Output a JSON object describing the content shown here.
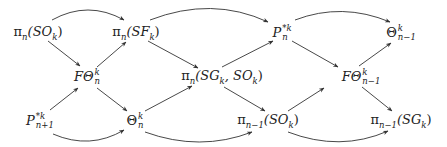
{
  "diagram": {
    "type": "commutative-diagram",
    "nodes": [
      {
        "id": "piSO",
        "label": "π_n(SO_k)",
        "base": "π",
        "sub": "n",
        "arg": "(SO",
        "argsub": "k",
        "close": ")",
        "x": 38,
        "y": 33
      },
      {
        "id": "piSF",
        "label": "π_n(SF_k)",
        "base": "π",
        "sub": "n",
        "arg": "(SF",
        "argsub": "k",
        "close": ")",
        "x": 136,
        "y": 33
      },
      {
        "id": "Pnk",
        "label": "P_n^{*k}",
        "base": "P",
        "sup": "*k",
        "sub": "n",
        "x": 282,
        "y": 33
      },
      {
        "id": "Thnm1",
        "label": "Θ^k_{n-1}",
        "base": "Θ",
        "sup": "k",
        "sub": "n−1",
        "x": 401,
        "y": 33
      },
      {
        "id": "FThn",
        "label": "FΘ^k_n",
        "base": "FΘ",
        "sup": "k",
        "sub": "n",
        "x": 87,
        "y": 77
      },
      {
        "id": "piSGSO",
        "label": "π_n(SG_k, SO_k)",
        "base": "π",
        "sub": "n",
        "arg": "(SG",
        "argsub": "k",
        "mid": ", SO",
        "midsub": "k",
        "close": ")",
        "x": 222,
        "y": 77
      },
      {
        "id": "FThnm1",
        "label": "FΘ^k_{n-1}",
        "base": "FΘ",
        "sup": "k",
        "sub": "n−1",
        "x": 361,
        "y": 77
      },
      {
        "id": "Pn1k",
        "label": "P^{*k}_{n+1}",
        "base": "P",
        "sup": "*k",
        "sub": "n+1",
        "x": 40,
        "y": 121
      },
      {
        "id": "Thn",
        "label": "Θ^k_n",
        "base": "Θ",
        "sup": "k",
        "sub": "n",
        "x": 135,
        "y": 121
      },
      {
        "id": "piSOm1",
        "label": "π_{n-1}(SO_k)",
        "base": "π",
        "sub": "n−1",
        "arg": "(SO",
        "argsub": "k",
        "close": ")",
        "x": 268,
        "y": 121
      },
      {
        "id": "piSGm1",
        "label": "π_{n-1}(SG_k)",
        "base": "π",
        "sub": "n−1",
        "arg": "(SG",
        "argsub": "k",
        "close": ")",
        "x": 401,
        "y": 121
      }
    ],
    "edges": [
      {
        "from": "piSO",
        "to": "piSF",
        "style": "curved"
      },
      {
        "from": "piSO",
        "to": "FThn",
        "style": "straight"
      },
      {
        "from": "FThn",
        "to": "piSF",
        "style": "straight"
      },
      {
        "from": "piSF",
        "to": "Pnk",
        "style": "curved"
      },
      {
        "from": "piSF",
        "to": "piSGSO",
        "style": "straight"
      },
      {
        "from": "piSGSO",
        "to": "Pnk",
        "style": "straight"
      },
      {
        "from": "Pnk",
        "to": "Thnm1",
        "style": "curved"
      },
      {
        "from": "Pnk",
        "to": "FThnm1",
        "style": "straight"
      },
      {
        "from": "FThnm1",
        "to": "Thnm1",
        "style": "straight"
      },
      {
        "from": "Pn1k",
        "to": "FThn",
        "style": "straight"
      },
      {
        "from": "FThn",
        "to": "Thn",
        "style": "straight"
      },
      {
        "from": "Pn1k",
        "to": "Thn",
        "style": "curved"
      },
      {
        "from": "Thn",
        "to": "piSGSO",
        "style": "straight"
      },
      {
        "from": "piSGSO",
        "to": "piSOm1",
        "style": "straight"
      },
      {
        "from": "Thn",
        "to": "piSOm1",
        "style": "curved"
      },
      {
        "from": "piSOm1",
        "to": "FThnm1",
        "style": "straight"
      },
      {
        "from": "FThnm1",
        "to": "piSGm1",
        "style": "straight"
      },
      {
        "from": "piSOm1",
        "to": "piSGm1",
        "style": "curved"
      }
    ],
    "colors": {
      "line": "#333333",
      "text": "#222222",
      "background": "#ffffff"
    }
  }
}
